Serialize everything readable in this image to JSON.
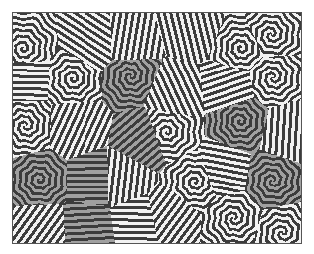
{
  "image": {
    "subject": "labyrinthine stripe pattern",
    "description": "Maze-like dark stripes with white gaps; several polygonal domains have a mid-gray background",
    "colors": {
      "stripe": "#3c3c3c",
      "gap": "#f2f2f2",
      "domain_gap": "#a0a0a0",
      "frame_border": "#555555",
      "page_background": "#ffffff"
    }
  }
}
